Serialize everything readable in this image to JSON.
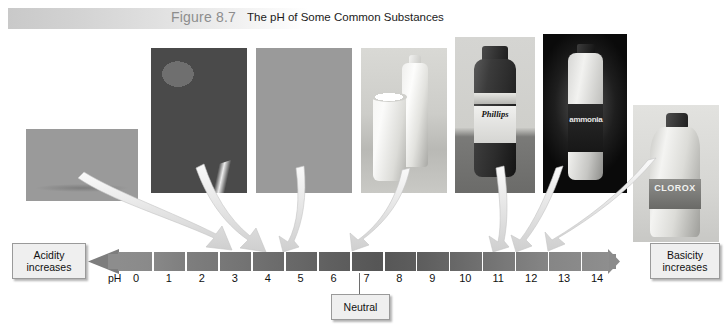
{
  "figure": {
    "number": "Figure 8.7",
    "title": "The pH of Some Common Substances"
  },
  "scale": {
    "axis_label": "pH",
    "ticks": [
      "0",
      "1",
      "2",
      "3",
      "4",
      "5",
      "6",
      "7",
      "8",
      "9",
      "10",
      "11",
      "12",
      "13",
      "14"
    ],
    "left_callout": {
      "line1": "Acidity",
      "line2": "increases"
    },
    "right_callout": {
      "line1": "Basicity",
      "line2": "increases"
    },
    "neutral_callout": "Neutral",
    "neutral_value": "7"
  },
  "photos": [
    {
      "name": "lemons",
      "caption": "Lemons",
      "ph": "2.3"
    },
    {
      "name": "strawberries",
      "caption": "Strawberries",
      "ph": "3.4"
    },
    {
      "name": "tomatoes",
      "caption": "Tomatoes",
      "ph": "4.2"
    },
    {
      "name": "milk",
      "caption": "Milk",
      "ph": "6.6"
    },
    {
      "name": "phillips",
      "caption": "Phillips",
      "ph": "10.5"
    },
    {
      "name": "ammonia",
      "caption": "ammonia",
      "ph": "11.1"
    },
    {
      "name": "clorox",
      "caption": "CLOROX",
      "ph": "12.2"
    }
  ],
  "colors": {
    "band_start": "#c9c9c9",
    "figure_number": "#8d8d8d",
    "title_text": "#1b1b1b",
    "scale_bar": "#6a6a6a",
    "arrow_fill": "#d9d9d9",
    "callout_bg": "#efefef",
    "callout_border": "#9a9a9a"
  },
  "chart_data": {
    "type": "bar",
    "title": "The pH of Some Common Substances",
    "xlabel": "pH",
    "ylabel": "",
    "xlim": [
      0,
      14
    ],
    "grid": false,
    "categories": [
      "Lemons",
      "Strawberries",
      "Tomatoes",
      "Milk",
      "Phillips",
      "ammonia",
      "CLOROX"
    ],
    "values": [
      2.3,
      3.4,
      4.2,
      6.6,
      10.5,
      11.1,
      12.2
    ],
    "tick_labels": [
      "0",
      "1",
      "2",
      "3",
      "4",
      "5",
      "6",
      "7",
      "8",
      "9",
      "10",
      "11",
      "12",
      "13",
      "14"
    ],
    "annotations": [
      "Acidity increases",
      "Neutral",
      "Basicity increases"
    ],
    "legend": []
  }
}
